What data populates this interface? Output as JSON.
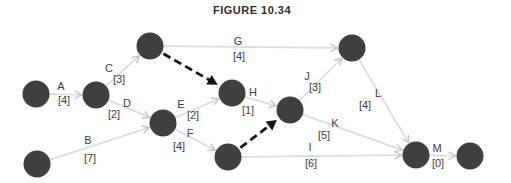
{
  "title": "FIGURE 10.34",
  "colors": {
    "background": "#ffffff",
    "node_fill": "#3f3f3f",
    "edge_stroke": "#dbdbdb",
    "edge_arrowhead": "#c4c4c4",
    "dummy_stroke": "#141414",
    "label_text": "#3d3d3d",
    "title_text": "#2e2e2e"
  },
  "diagram": {
    "type": "activity-on-arrow-network",
    "node_radius": 13.5,
    "nodes": [
      {
        "id": "n1",
        "x": 36,
        "y": 94
      },
      {
        "id": "n2",
        "x": 96,
        "y": 95
      },
      {
        "id": "n3",
        "x": 150,
        "y": 46
      },
      {
        "id": "n4",
        "x": 163,
        "y": 123
      },
      {
        "id": "n5",
        "x": 232,
        "y": 93
      },
      {
        "id": "n6",
        "x": 228,
        "y": 157
      },
      {
        "id": "n7",
        "x": 290,
        "y": 110
      },
      {
        "id": "n8",
        "x": 352,
        "y": 48
      },
      {
        "id": "n9",
        "x": 416,
        "y": 155
      },
      {
        "id": "n10",
        "x": 470,
        "y": 156
      },
      {
        "id": "n11",
        "x": 37,
        "y": 164
      }
    ],
    "activities": [
      {
        "id": "A",
        "from": "n1",
        "to": "n2",
        "label": "A",
        "duration": "[4]",
        "label_pos": [
          61,
          90
        ],
        "duration_pos": [
          64,
          104
        ]
      },
      {
        "id": "B",
        "from": "n11",
        "to": "n4",
        "label": "B",
        "duration": "[7]",
        "label_pos": [
          88,
          144
        ],
        "duration_pos": [
          90,
          162
        ]
      },
      {
        "id": "C",
        "from": "n2",
        "to": "n3",
        "label": "C",
        "duration": "[3]",
        "label_pos": [
          109,
          72
        ],
        "duration_pos": [
          119,
          83
        ]
      },
      {
        "id": "D",
        "from": "n2",
        "to": "n4",
        "label": "D",
        "duration": "[2]",
        "label_pos": [
          127,
          107
        ],
        "duration_pos": [
          114,
          118
        ]
      },
      {
        "id": "E",
        "from": "n4",
        "to": "n5",
        "label": "E",
        "duration": "[2]",
        "label_pos": [
          181,
          108
        ],
        "duration_pos": [
          193,
          119
        ]
      },
      {
        "id": "F",
        "from": "n4",
        "to": "n6",
        "label": "F",
        "duration": "[4]",
        "label_pos": [
          190,
          137
        ],
        "duration_pos": [
          179,
          150
        ]
      },
      {
        "id": "G",
        "from": "n3",
        "to": "n8",
        "label": "G",
        "duration": "[4]",
        "label_pos": [
          238,
          45
        ],
        "duration_pos": [
          239,
          60
        ]
      },
      {
        "id": "H",
        "from": "n5",
        "to": "n7",
        "label": "H",
        "duration": "[1]",
        "label_pos": [
          253,
          96
        ],
        "duration_pos": [
          248,
          114
        ]
      },
      {
        "id": "I",
        "from": "n6",
        "to": "n9",
        "label": "I",
        "duration": "[6]",
        "label_pos": [
          310,
          151
        ],
        "duration_pos": [
          311,
          167
        ]
      },
      {
        "id": "J",
        "from": "n7",
        "to": "n8",
        "label": "J",
        "duration": "[3]",
        "label_pos": [
          307,
          80
        ],
        "duration_pos": [
          315,
          91
        ]
      },
      {
        "id": "K",
        "from": "n7",
        "to": "n9",
        "label": "K",
        "duration": "[5]",
        "label_pos": [
          335,
          127
        ],
        "duration_pos": [
          324,
          139
        ]
      },
      {
        "id": "L",
        "from": "n8",
        "to": "n9",
        "label": "L",
        "duration": "[4]",
        "label_pos": [
          378,
          97
        ],
        "duration_pos": [
          365,
          109
        ]
      },
      {
        "id": "M",
        "from": "n9",
        "to": "n10",
        "label": "M",
        "duration": "[0]",
        "label_pos": [
          437,
          152
        ],
        "duration_pos": [
          438,
          167
        ]
      }
    ],
    "dummy_activities": [
      {
        "id": "dummy-1",
        "from": "n3",
        "to": "n5"
      },
      {
        "id": "dummy-2",
        "from": "n6",
        "to": "n7"
      }
    ]
  }
}
